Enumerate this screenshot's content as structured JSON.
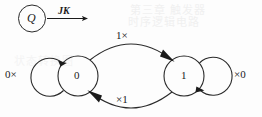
{
  "diagram": {
    "type": "state-transition-diagram",
    "title_symbol": "Q",
    "input_label": "JK",
    "states": [
      {
        "id": "s0",
        "label": "0"
      },
      {
        "id": "s1",
        "label": "1"
      }
    ],
    "transitions": [
      {
        "id": "t-self-0",
        "from": "s0",
        "to": "s0",
        "label": "0×",
        "shape": "self-loop-left"
      },
      {
        "id": "t-0-to-1",
        "from": "s0",
        "to": "s1",
        "label": "1×",
        "shape": "arc-top"
      },
      {
        "id": "t-1-to-0",
        "from": "s1",
        "to": "s0",
        "label": "×1",
        "shape": "arc-bottom"
      },
      {
        "id": "t-self-1",
        "from": "s1",
        "to": "s1",
        "label": "×0",
        "shape": "self-loop-right"
      }
    ],
    "colors": {
      "ink": "#1b1b1b",
      "stroke": "#2a2a2a",
      "background": "#fdfdfd",
      "bleed_through": "#f0f0f0"
    },
    "background_bleed": {
      "line1": "第三章  触发器",
      "line2": "时序逻辑电路",
      "line3": "状态转换图"
    }
  }
}
